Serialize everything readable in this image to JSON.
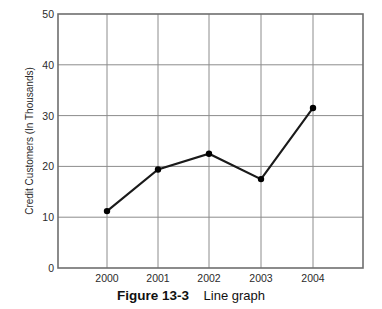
{
  "caption": {
    "label": "Figure 13-3",
    "text": "Line graph"
  },
  "colors": {
    "line": "#1a1a1a",
    "marker": "#000000",
    "grid": "#8c8c8c",
    "axis": "#6e6e6e",
    "text": "#2b2b2b",
    "background": "#ffffff"
  },
  "chart_data": {
    "type": "line",
    "title": "",
    "subtitle": "",
    "xlabel": "",
    "ylabel": "Credit Customers (In Thousands)",
    "categories": [
      "2000",
      "2001",
      "2002",
      "2003",
      "2004"
    ],
    "x": [
      2000,
      2001,
      2002,
      2003,
      2004
    ],
    "values": [
      11.2,
      19.4,
      22.5,
      17.5,
      31.5
    ],
    "series": [
      {
        "name": "Credit Customers",
        "values": [
          11.2,
          19.4,
          22.5,
          17.5,
          31.5
        ]
      }
    ],
    "ylim": [
      0,
      50
    ],
    "yticks": [
      0,
      10,
      20,
      30,
      40,
      50
    ],
    "ytick_labels": [
      "0",
      "10",
      "20",
      "30",
      "40",
      "50"
    ],
    "xtick_labels": [
      "2000",
      "2001",
      "2002",
      "2003",
      "2004"
    ],
    "grid": true,
    "grid_axis": "both",
    "legend": false,
    "legend_position": "none",
    "markers": "filled-circle",
    "annotations": []
  }
}
